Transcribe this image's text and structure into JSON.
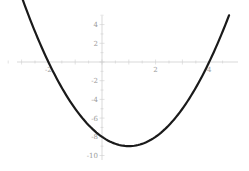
{
  "chart_data": {
    "type": "line",
    "title": "",
    "xlabel": "",
    "ylabel": "",
    "function": "x^2 - 2x - 8",
    "xlim": [
      -3.74,
      4.74
    ],
    "ylim": [
      -10,
      5
    ],
    "grid": false,
    "legend": null,
    "x_ticks": [
      -2,
      2,
      4
    ],
    "x_tick_labels": [
      "-2",
      "2",
      "4"
    ],
    "y_ticks": [
      4,
      2,
      -2,
      -4,
      -6,
      -8,
      -10
    ],
    "y_tick_labels": [
      "4",
      "2",
      "-2",
      "-4",
      "-6",
      "-8",
      "-10"
    ],
    "series": [
      {
        "name": "y = x^2 - 2x - 8",
        "color": "#1a1a1a",
        "x": [
          -2.74,
          -2.5,
          -2,
          -1.5,
          -1,
          -0.5,
          0,
          0.5,
          1,
          1.5,
          2,
          2.5,
          3,
          3.5,
          4,
          4.5,
          4.74
        ],
        "y": [
          5.0,
          3.25,
          0,
          -2.75,
          -5,
          -6.75,
          -8,
          -8.75,
          -9,
          -8.75,
          -8,
          -6.75,
          -5,
          -2.75,
          0,
          3.25,
          5.0
        ]
      }
    ],
    "roots": [
      -2,
      4
    ],
    "vertex": [
      1,
      -9
    ]
  },
  "axes": {
    "color": "#cfcfcf",
    "label_color": "#9a9a9a"
  }
}
